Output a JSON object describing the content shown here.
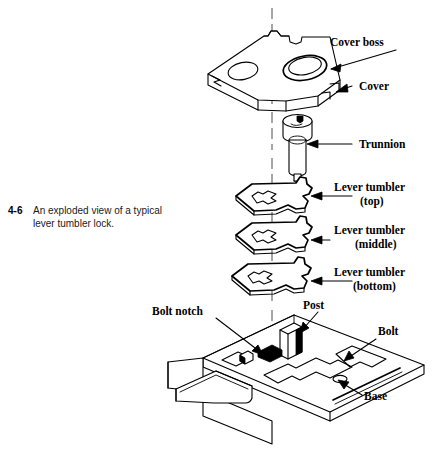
{
  "figure": {
    "number": "4-6",
    "caption_line1": "An exploded view of a typical",
    "caption_line2": "lever tumbler lock.",
    "title": "An exploded view of a typical lever tumbler lock."
  },
  "labels": {
    "cover_boss": "Cover boss",
    "cover": "Cover",
    "trunnion": "Trunnion",
    "lever_tumbler_top_line1": "Lever tumbler",
    "lever_tumbler_top_line2": "(top)",
    "lever_tumbler_middle_line1": "Lever tumbler",
    "lever_tumbler_middle_line2": "(middle)",
    "lever_tumbler_bottom_line1": "Lever tumbler",
    "lever_tumbler_bottom_line2": "(bottom)",
    "bolt_notch": "Bolt notch",
    "post": "Post",
    "bolt": "Bolt",
    "base": "Base"
  },
  "parts": [
    {
      "id": "cover",
      "name": "Cover",
      "detail": "Plate with cover boss and plain hole"
    },
    {
      "id": "cover-boss",
      "name": "Cover boss",
      "detail": "Raised collar ring on cover"
    },
    {
      "id": "trunnion",
      "name": "Trunnion",
      "detail": "Cylindrical pivot post with head"
    },
    {
      "id": "lever-tumbler-top",
      "name": "Lever tumbler (top)",
      "detail": "Tumbler plate with gate slot"
    },
    {
      "id": "lever-tumbler-middle",
      "name": "Lever tumbler (middle)",
      "detail": "Tumbler plate with gate slot"
    },
    {
      "id": "lever-tumbler-bottom",
      "name": "Lever tumbler (bottom)",
      "detail": "Tumbler plate with gate slot"
    },
    {
      "id": "post",
      "name": "Post",
      "detail": "Upright post on base"
    },
    {
      "id": "bolt",
      "name": "Bolt",
      "detail": "Sliding bolt on base"
    },
    {
      "id": "bolt-notch",
      "name": "Bolt notch",
      "detail": "Notch cut in bolt"
    },
    {
      "id": "base",
      "name": "Base",
      "detail": "Lock base plate with flange"
    }
  ],
  "colors": {
    "ink": "#000000",
    "paper": "#ffffff",
    "centerline": "#4d4d4d"
  }
}
